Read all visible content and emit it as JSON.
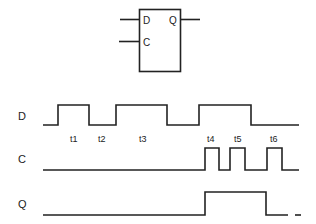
{
  "flipflop": {
    "input_d": "D",
    "input_c": "C",
    "output_q": "Q"
  },
  "signals": [
    {
      "name": "D"
    },
    {
      "name": "C"
    },
    {
      "name": "Q"
    }
  ],
  "time_markers": [
    "t1",
    "t2",
    "t3",
    "t4",
    "t5",
    "t6"
  ],
  "colors": {
    "line": "#222222",
    "background": "#ffffff"
  }
}
